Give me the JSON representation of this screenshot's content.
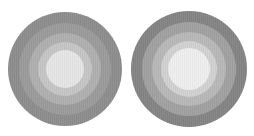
{
  "figures": [
    {
      "name": "left-concentric-circle",
      "center": [
        65,
        69
      ],
      "rings": [
        {
          "radius": 57,
          "color": "#8e8e8e"
        },
        {
          "radius": 46,
          "color": "#9c9c9c"
        },
        {
          "radius": 36,
          "color": "#b0b0b0"
        },
        {
          "radius": 27,
          "color": "#c6c6c6"
        },
        {
          "radius": 19,
          "color": "#e6e6e6"
        }
      ]
    },
    {
      "name": "right-concentric-circle",
      "center": [
        189,
        69
      ],
      "rings": [
        {
          "radius": 58,
          "color": "#858585"
        },
        {
          "radius": 47,
          "color": "#a2a2a2"
        },
        {
          "radius": 37,
          "color": "#b9b9b9"
        },
        {
          "radius": 28,
          "color": "#d2d2d2"
        },
        {
          "radius": 21,
          "color": "#efefef"
        }
      ]
    }
  ]
}
